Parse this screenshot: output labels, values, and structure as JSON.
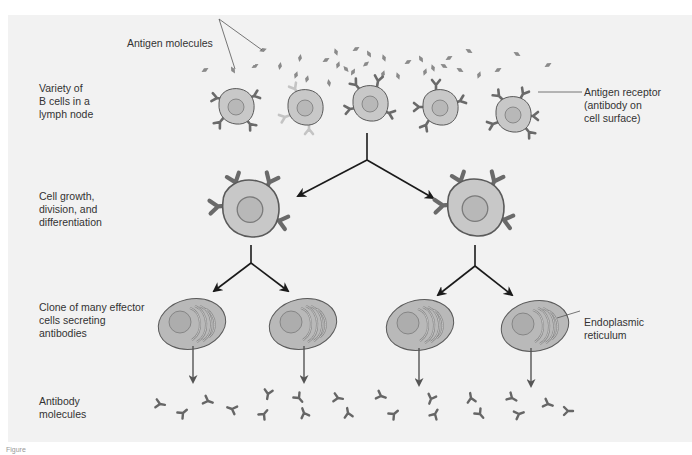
{
  "figure": {
    "colors": {
      "background": "#f2f2f2",
      "cell_fill": "#c8c8c8",
      "cell_stroke": "#5a5a5a",
      "nucleus_fill": "#b5b5b5",
      "receptor": "#6a6a6a",
      "receptor_light": "#bdbdbd",
      "antigen": "#8a8a8a",
      "arrow": "#1a1a1a",
      "secretion_arrow": "#555555",
      "text": "#333333"
    }
  },
  "row_labels": {
    "variety": "Variety of\nB cells in a\nlymph node",
    "growth": "Cell growth,\ndivision, and\ndifferentiation",
    "clone": "Clone of many effector\ncells secreting\nantibodies",
    "antibody": "Antibody\nmolecules"
  },
  "callouts": {
    "antigen_molecules": "Antigen molecules",
    "antigen_receptor": "Antigen receptor\n(antibody on\ncell surface)",
    "endoplasmic_reticulum": "Endoplasmic\nreticulum"
  },
  "caption": "Figure"
}
